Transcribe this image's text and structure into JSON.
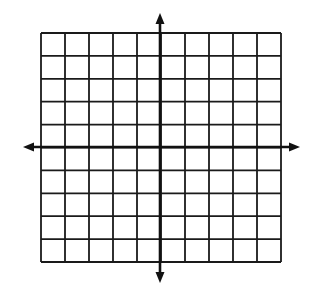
{
  "diagram": {
    "type": "coordinate-grid",
    "columns": 10,
    "rows": 10,
    "grid": {
      "left": 41,
      "top": 33,
      "right": 281,
      "bottom": 262
    },
    "axes": {
      "x_axis_y": 147,
      "y_axis_x": 160,
      "x_arrow_left": 23,
      "x_arrow_right": 300,
      "y_arrow_top": 13,
      "y_arrow_bottom": 283
    },
    "colors": {
      "background": "#ffffff",
      "grid_line": "#1a1a1a",
      "axis": "#111111"
    }
  }
}
